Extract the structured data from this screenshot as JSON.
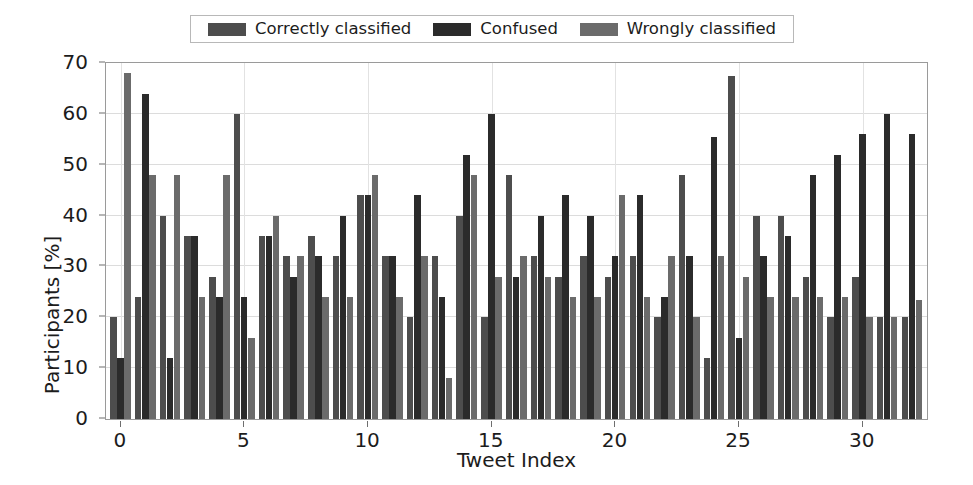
{
  "figure": {
    "background_color": "#ffffff",
    "plot_background_color": "#ffffff",
    "frame_color": "#9a9a9a",
    "grid_color": "#dcdcdc"
  },
  "legend": {
    "position": "upper-center-outside",
    "border_color": "#b8b8b8",
    "entries": [
      {
        "label": "Correctly classified",
        "color": "#4d4d4d"
      },
      {
        "label": "Confused",
        "color": "#2b2b2b"
      },
      {
        "label": "Wrongly classified",
        "color": "#6b6b6b"
      }
    ]
  },
  "axes": {
    "y_title": "Participants [%]",
    "x_title": "Tweet Index",
    "y_ticks": [
      0,
      10,
      20,
      30,
      40,
      50,
      60,
      70
    ],
    "x_ticks": [
      0,
      5,
      10,
      15,
      20,
      25,
      30
    ],
    "ylim": [
      0,
      70
    ],
    "xlim": [
      -0.6,
      32.6
    ],
    "grid": "horizontal-and-vertical-light"
  },
  "chart_data": {
    "type": "bar",
    "title": "",
    "subtitle": "",
    "xlabel": "Tweet Index",
    "ylabel": "Participants [%]",
    "ylim": [
      0,
      70
    ],
    "grid": true,
    "legend_position": "top",
    "categories": [
      0,
      1,
      2,
      3,
      4,
      5,
      6,
      7,
      8,
      9,
      10,
      11,
      12,
      13,
      14,
      15,
      16,
      17,
      18,
      19,
      20,
      21,
      22,
      23,
      24,
      25,
      26,
      27,
      28,
      29,
      30,
      31,
      32
    ],
    "series": [
      {
        "name": "Correctly classified",
        "color": "#4d4d4d",
        "values": [
          20.0,
          24.0,
          40.0,
          36.0,
          28.0,
          60.0,
          36.0,
          32.0,
          36.0,
          32.0,
          44.0,
          32.0,
          20.0,
          32.0,
          40.0,
          20.0,
          48.0,
          32.0,
          28.0,
          32.0,
          28.0,
          32.0,
          20.0,
          48.0,
          12.0,
          67.5,
          40.0,
          40.0,
          28.0,
          20.0,
          28.0,
          20.0,
          20.0
        ]
      },
      {
        "name": "Confused",
        "color": "#2b2b2b",
        "values": [
          12.0,
          64.0,
          12.0,
          36.0,
          24.0,
          24.0,
          36.0,
          28.0,
          32.0,
          40.0,
          44.0,
          32.0,
          44.0,
          24.0,
          52.0,
          60.0,
          28.0,
          40.0,
          44.0,
          40.0,
          32.0,
          44.0,
          24.0,
          32.0,
          55.5,
          16.0,
          32.0,
          36.0,
          48.0,
          52.0,
          56.0,
          60.0,
          56.0
        ]
      },
      {
        "name": "Wrongly classified",
        "color": "#6b6b6b",
        "values": [
          68.0,
          48.0,
          48.0,
          24.0,
          48.0,
          16.0,
          40.0,
          32.0,
          24.0,
          24.0,
          48.0,
          24.0,
          32.0,
          8.0,
          48.0,
          28.0,
          32.0,
          28.0,
          24.0,
          24.0,
          44.0,
          24.0,
          32.0,
          20.0,
          32.0,
          28.0,
          24.0,
          24.0,
          24.0,
          24.0,
          20.0,
          20.0,
          23.5
        ]
      }
    ]
  }
}
